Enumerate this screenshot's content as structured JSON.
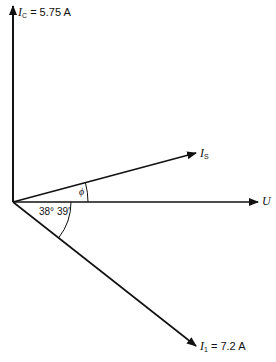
{
  "diagram": {
    "type": "phasor-diagram",
    "origin": [
      13,
      202
    ],
    "phasors": [
      {
        "id": "Ic",
        "symbol": "I",
        "subscript": "C",
        "value_text": "= 5.75 A",
        "tip": [
          13,
          5
        ]
      },
      {
        "id": "Is",
        "symbol": "I",
        "subscript": "S",
        "value_text": "",
        "tip": [
          196,
          153
        ]
      },
      {
        "id": "U",
        "symbol": "U",
        "subscript": "",
        "value_text": "",
        "tip": [
          258,
          201
        ]
      },
      {
        "id": "I1",
        "symbol": "I",
        "subscript": "1",
        "value_text": "= 7.2 A",
        "tip": [
          196,
          346
        ]
      }
    ],
    "angles": [
      {
        "id": "phi",
        "label": "ϕ",
        "between": [
          "U",
          "Is"
        ]
      },
      {
        "id": "theta",
        "label": "38° 39′",
        "between": [
          "U",
          "I1"
        ]
      }
    ],
    "colors": {
      "line": "#111111",
      "background": "#ffffff"
    }
  }
}
